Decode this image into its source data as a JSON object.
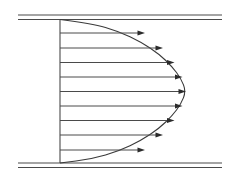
{
  "figure": {
    "width": 244,
    "height": 183,
    "background_color": "#ffffff",
    "line_color": "#4a4a4a",
    "curve_color": "#3a3a3a",
    "arrow_color": "#2b2b2b"
  },
  "walls": {
    "x_start": 18,
    "x_end": 222,
    "top": {
      "outer_y": 15.0,
      "inner_y": 19.5
    },
    "bottom": {
      "outer_y": 167.5,
      "inner_y": 163.0
    }
  },
  "inlet_line": {
    "x": 60,
    "y_top": 19.5,
    "y_bottom": 163.0
  },
  "chart_data": {
    "type": "line",
    "xlabel": "",
    "ylabel": "",
    "xlim": [
      60,
      222
    ],
    "ylim": [
      19.5,
      163.0
    ],
    "grid": false,
    "legend": null,
    "profile_shape": "parabolic",
    "wall_top_y": 19.5,
    "wall_bottom_y": 163.0,
    "centerline_y": 91.25,
    "origin_x": 60,
    "max_velocity_x": 186,
    "max_velocity_length": 126,
    "arrow_count": 9,
    "arrows": [
      {
        "index": 1,
        "y": 33.0,
        "x_start": 60,
        "x_tip": 145.0,
        "length": 85.0,
        "normalized_velocity": 0.675
      },
      {
        "index": 2,
        "y": 48.0,
        "x_start": 60,
        "x_tip": 163.0,
        "length": 103.0,
        "normalized_velocity": 0.817
      },
      {
        "index": 3,
        "y": 62.5,
        "x_start": 60,
        "x_tip": 174.5,
        "length": 114.5,
        "normalized_velocity": 0.909
      },
      {
        "index": 4,
        "y": 77.0,
        "x_start": 60,
        "x_tip": 182.5,
        "length": 122.5,
        "normalized_velocity": 0.972
      },
      {
        "index": 5,
        "y": 91.5,
        "x_start": 60,
        "x_tip": 186.0,
        "length": 126.0,
        "normalized_velocity": 1.0
      },
      {
        "index": 6,
        "y": 106.0,
        "x_start": 60,
        "x_tip": 182.5,
        "length": 122.5,
        "normalized_velocity": 0.972
      },
      {
        "index": 7,
        "y": 120.5,
        "x_start": 60,
        "x_tip": 174.5,
        "length": 114.5,
        "normalized_velocity": 0.909
      },
      {
        "index": 8,
        "y": 135.0,
        "x_start": 60,
        "x_tip": 163.0,
        "length": 103.0,
        "normalized_velocity": 0.817
      },
      {
        "index": 9,
        "y": 150.0,
        "x_start": 60,
        "x_tip": 145.0,
        "length": 85.0,
        "normalized_velocity": 0.675
      }
    ],
    "curve_points": [
      {
        "x": 60.0,
        "y": 19.5
      },
      {
        "x": 92.0,
        "y": 23.5
      },
      {
        "x": 119.0,
        "y": 31.5
      },
      {
        "x": 141.0,
        "y": 42.0
      },
      {
        "x": 159.0,
        "y": 54.0
      },
      {
        "x": 172.0,
        "y": 66.5
      },
      {
        "x": 181.0,
        "y": 78.5
      },
      {
        "x": 186.0,
        "y": 91.25
      },
      {
        "x": 181.0,
        "y": 104.0
      },
      {
        "x": 172.0,
        "y": 116.0
      },
      {
        "x": 159.0,
        "y": 128.5
      },
      {
        "x": 141.0,
        "y": 140.5
      },
      {
        "x": 119.0,
        "y": 151.0
      },
      {
        "x": 92.0,
        "y": 159.0
      },
      {
        "x": 60.0,
        "y": 163.0
      }
    ]
  }
}
